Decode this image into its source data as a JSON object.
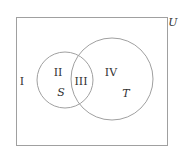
{
  "diagram": {
    "type": "venn",
    "universe": {
      "label": "U",
      "x": 16,
      "y": 17,
      "width": 151,
      "height": 128
    },
    "stroke_color": "#a0a0a0",
    "sets": [
      {
        "name": "S",
        "cx": 65,
        "cy": 80,
        "r": 28,
        "label_pos": [
          61,
          92
        ]
      },
      {
        "name": "T",
        "cx": 112,
        "cy": 79,
        "r": 41,
        "label_pos": [
          126,
          93
        ]
      }
    ],
    "regions": [
      {
        "label": "I",
        "description": "outside S and T",
        "pos": [
          22,
          81
        ]
      },
      {
        "label": "II",
        "description": "S only",
        "pos": [
          58,
          72
        ]
      },
      {
        "label": "III",
        "description": "S and T",
        "pos": [
          81,
          81
        ]
      },
      {
        "label": "IV",
        "description": "T only",
        "pos": [
          111,
          72
        ]
      }
    ],
    "universe_label_pos": [
      173,
      22
    ]
  },
  "labels": {
    "universe": "U",
    "set_s": "S",
    "set_t": "T",
    "region_1": "I",
    "region_2": "II",
    "region_3": "III",
    "region_4": "IV"
  }
}
